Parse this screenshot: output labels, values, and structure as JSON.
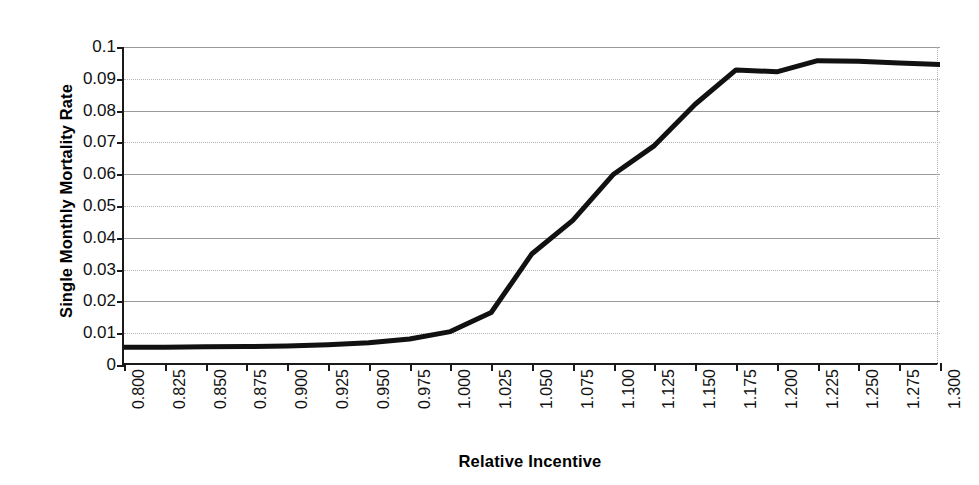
{
  "chart_data": {
    "type": "line",
    "title": "",
    "xlabel": "Relative Incentive",
    "ylabel": "Single Monthly Mortality Rate",
    "xlim": [
      0.8,
      1.3
    ],
    "ylim": [
      0,
      0.1
    ],
    "grid": true,
    "legend": "none",
    "x_tick_labels": [
      "0.800",
      "0.825",
      "0.850",
      "0.875",
      "0.900",
      "0.925",
      "0.950",
      "0.975",
      "1.000",
      "1.025",
      "1.050",
      "1.075",
      "1.100",
      "1.125",
      "1.150",
      "1.175",
      "1.200",
      "1.225",
      "1.250",
      "1.275",
      "1.300"
    ],
    "y_tick_labels": [
      "0.1",
      "0.09",
      "0.08",
      "0.07",
      "0.06",
      "0.05",
      "0.04",
      "0.03",
      "0.02",
      "0.01",
      "0"
    ],
    "y_tick_values": [
      0.1,
      0.09,
      0.08,
      0.07,
      0.06,
      0.05,
      0.04,
      0.03,
      0.02,
      0.01,
      0
    ],
    "x": [
      0.8,
      0.825,
      0.85,
      0.875,
      0.9,
      0.925,
      0.95,
      0.975,
      1.0,
      1.025,
      1.05,
      1.075,
      1.1,
      1.125,
      1.15,
      1.175,
      1.2,
      1.225,
      1.25,
      1.275,
      1.3
    ],
    "values": [
      0.0056,
      0.0056,
      0.0057,
      0.0058,
      0.006,
      0.0064,
      0.007,
      0.0082,
      0.0105,
      0.0165,
      0.035,
      0.0455,
      0.06,
      0.069,
      0.082,
      0.0928,
      0.0922,
      0.0957,
      0.0955,
      0.095,
      0.0945
    ],
    "series": [
      {
        "name": "Single Monthly Mortality Rate",
        "color": "#111111",
        "values": [
          0.0056,
          0.0056,
          0.0057,
          0.0058,
          0.006,
          0.0064,
          0.007,
          0.0082,
          0.0105,
          0.0165,
          0.035,
          0.0455,
          0.06,
          0.069,
          0.082,
          0.0928,
          0.0922,
          0.0957,
          0.0955,
          0.095,
          0.0945
        ]
      }
    ]
  },
  "colors": {
    "curve": "#111111",
    "axis": "#1a1a1a",
    "grid": "#9a9a9a",
    "background": "#ffffff"
  }
}
